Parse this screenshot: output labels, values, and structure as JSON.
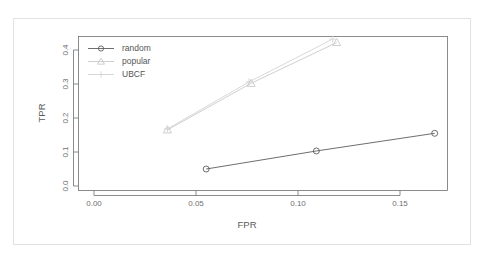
{
  "chart_data": {
    "type": "line",
    "title": "",
    "xlabel": "FPR",
    "ylabel": "TPR",
    "xlim": [
      0.0,
      0.1785
    ],
    "ylim": [
      0.0,
      0.455
    ],
    "xticks": [
      0.0,
      0.05,
      0.1,
      0.15
    ],
    "xticklabels": [
      "0.00",
      "0.05",
      "0.10",
      "0.15"
    ],
    "yticks": [
      0.0,
      0.1,
      0.2,
      0.3,
      0.4
    ],
    "yticklabels": [
      "0.0",
      "0.1",
      "0.2",
      "0.3",
      "0.4"
    ],
    "grid": false,
    "legend_position": "top-left",
    "series": [
      {
        "name": "random",
        "marker": "circle",
        "color": "#5e5e5e",
        "x": [
          0.055,
          0.109,
          0.167
        ],
        "y": [
          0.05,
          0.103,
          0.155
        ]
      },
      {
        "name": "popular",
        "marker": "triangle",
        "color": "#c9c9c9",
        "x": [
          0.036,
          0.077,
          0.119
        ],
        "y": [
          0.165,
          0.302,
          0.422
        ]
      },
      {
        "name": "UBCF",
        "marker": "plus",
        "color": "#d4d4d4",
        "x": [
          0.036,
          0.076,
          0.117
        ],
        "y": [
          0.168,
          0.306,
          0.432
        ]
      }
    ]
  },
  "legend": {
    "entries": [
      {
        "label": "random"
      },
      {
        "label": "popular"
      },
      {
        "label": "UBCF"
      }
    ]
  },
  "axes": {
    "x_title": "FPR",
    "y_title": "TPR"
  },
  "colors": {
    "frame": "#6f6f6f",
    "outer_border": "#e2e2e2",
    "background": "#ffffff",
    "random": "#5e5e5e",
    "popular": "#c9c9c9",
    "ubcf": "#d4d4d4"
  }
}
